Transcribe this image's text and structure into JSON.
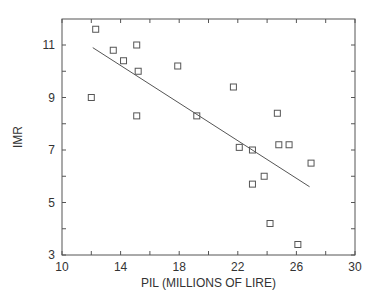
{
  "chart_data": {
    "type": "scatter",
    "title": "",
    "xlabel": "PIL (MILLIONS OF LIRE)",
    "ylabel": "IMR",
    "xlim": [
      10,
      30
    ],
    "ylim": [
      3,
      12
    ],
    "x_ticks": [
      10,
      14,
      18,
      22,
      26,
      30
    ],
    "x_minor_ticks": [
      12,
      16,
      20,
      24,
      28
    ],
    "y_ticks": [
      3,
      5,
      7,
      9,
      11
    ],
    "y_minor_ticks": [
      4,
      6,
      8,
      10
    ],
    "grid": false,
    "legend": null,
    "series": [
      {
        "name": "observations",
        "marker": "open-square",
        "points": [
          {
            "x": 12.3,
            "y": 11.6
          },
          {
            "x": 13.5,
            "y": 10.8
          },
          {
            "x": 15.1,
            "y": 11.0
          },
          {
            "x": 14.2,
            "y": 10.4
          },
          {
            "x": 15.2,
            "y": 10.0
          },
          {
            "x": 12.0,
            "y": 9.0
          },
          {
            "x": 15.1,
            "y": 8.3
          },
          {
            "x": 17.9,
            "y": 10.2
          },
          {
            "x": 21.7,
            "y": 9.4
          },
          {
            "x": 19.2,
            "y": 8.3
          },
          {
            "x": 24.7,
            "y": 8.4
          },
          {
            "x": 22.1,
            "y": 7.1
          },
          {
            "x": 23.0,
            "y": 7.0
          },
          {
            "x": 24.8,
            "y": 7.2
          },
          {
            "x": 25.5,
            "y": 7.2
          },
          {
            "x": 27.0,
            "y": 6.5
          },
          {
            "x": 23.8,
            "y": 6.0
          },
          {
            "x": 23.0,
            "y": 5.7
          },
          {
            "x": 24.2,
            "y": 4.2
          },
          {
            "x": 26.1,
            "y": 3.4
          }
        ]
      },
      {
        "name": "regression line",
        "type": "line",
        "points": [
          {
            "x": 12.1,
            "y": 10.9
          },
          {
            "x": 26.9,
            "y": 5.6
          }
        ]
      }
    ]
  },
  "colors": {
    "axis": "#555555",
    "marker": "#555555",
    "line": "#555555",
    "text": "#333333"
  }
}
